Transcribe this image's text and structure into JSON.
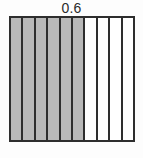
{
  "figure": {
    "label": "0.6",
    "title": "0.6"
  },
  "chart_data": {
    "type": "bar",
    "title": "0.6",
    "subtitle": "",
    "xlabel": "",
    "ylabel": "",
    "total_parts": 10,
    "shaded_parts": 6,
    "unshaded_parts": 4,
    "fraction": "6/10",
    "decimal": 0.6,
    "percent": 60,
    "orientation": "vertical-columns",
    "grid": true,
    "legend_position": "none",
    "categories": [
      "1",
      "2",
      "3",
      "4",
      "5",
      "6",
      "7",
      "8",
      "9",
      "10"
    ],
    "values": [
      1,
      1,
      1,
      1,
      1,
      1,
      1,
      1,
      1,
      1
    ],
    "columns": [
      {
        "index": 1,
        "shaded": true
      },
      {
        "index": 2,
        "shaded": true
      },
      {
        "index": 3,
        "shaded": true
      },
      {
        "index": 4,
        "shaded": true
      },
      {
        "index": 5,
        "shaded": true
      },
      {
        "index": 6,
        "shaded": true
      },
      {
        "index": 7,
        "shaded": false
      },
      {
        "index": 8,
        "shaded": false
      },
      {
        "index": 9,
        "shaded": false
      },
      {
        "index": 10,
        "shaded": false
      }
    ]
  },
  "colors": {
    "shaded_fill": "#b9b9b9",
    "unshaded_fill": "#ffffff",
    "outline": "#2e2e2e",
    "divider": "#2e2e2e",
    "label_text": "#2b2b2b",
    "background": "#fdfdfd"
  }
}
